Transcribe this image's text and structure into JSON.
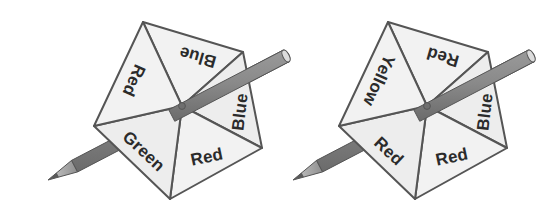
{
  "figure": {
    "background_color": "#ffffff",
    "sector_fill": "#f2f2f2",
    "sector_fill_alt": "#ededed",
    "outline_color": "#555555",
    "pencil_body_color": "#8a8a8a",
    "pencil_shadow_color": "#6e6e6e",
    "pencil_tip_color": "#d9d9d9",
    "label_color": "#2b2b2b"
  },
  "spinners": [
    {
      "id": "spinner-left",
      "name": "left-spinner",
      "shape": "pentagon",
      "sector_count": 5,
      "center": {
        "x": 182,
        "y": 106
      },
      "vertices": [
        {
          "x": 143,
          "y": 22
        },
        {
          "x": 243,
          "y": 52
        },
        {
          "x": 262,
          "y": 148
        },
        {
          "x": 170,
          "y": 199
        },
        {
          "x": 94,
          "y": 126
        }
      ],
      "sectors": [
        {
          "index": 0,
          "label": "Blue",
          "rotation": 196,
          "cx": 198,
          "cy": 56
        },
        {
          "index": 1,
          "label": "Blue",
          "rotation": 277,
          "cx": 241,
          "cy": 112
        },
        {
          "index": 2,
          "label": "Red",
          "rotation": 348,
          "cx": 207,
          "cy": 158
        },
        {
          "index": 3,
          "label": "Green",
          "rotation": 43,
          "cx": 143,
          "cy": 152
        },
        {
          "index": 4,
          "label": "Red",
          "rotation": 114,
          "cx": 133,
          "cy": 80
        }
      ],
      "pencil": {
        "name": "pencil-pointer",
        "tip": {
          "x": 48,
          "y": 180
        },
        "butt": {
          "x": 286,
          "y": 56
        }
      }
    },
    {
      "id": "spinner-right",
      "name": "right-spinner",
      "shape": "pentagon",
      "sector_count": 5,
      "center": {
        "x": 427,
        "y": 106
      },
      "vertices": [
        {
          "x": 388,
          "y": 22
        },
        {
          "x": 488,
          "y": 52
        },
        {
          "x": 507,
          "y": 148
        },
        {
          "x": 415,
          "y": 199
        },
        {
          "x": 339,
          "y": 126
        }
      ],
      "sectors": [
        {
          "index": 0,
          "label": "Red",
          "rotation": 196,
          "cx": 443,
          "cy": 56
        },
        {
          "index": 1,
          "label": "Blue",
          "rotation": 277,
          "cx": 486,
          "cy": 112
        },
        {
          "index": 2,
          "label": "Red",
          "rotation": 348,
          "cx": 452,
          "cy": 158
        },
        {
          "index": 3,
          "label": "Red",
          "rotation": 43,
          "cx": 388,
          "cy": 152
        },
        {
          "index": 4,
          "label": "Yellow",
          "rotation": 114,
          "cx": 378,
          "cy": 80
        }
      ],
      "pencil": {
        "name": "pencil-pointer",
        "tip": {
          "x": 293,
          "y": 180
        },
        "butt": {
          "x": 531,
          "y": 56
        }
      }
    }
  ],
  "labels": {
    "left": [
      "Blue",
      "Blue",
      "Red",
      "Green",
      "Red"
    ],
    "right": [
      "Red",
      "Blue",
      "Red",
      "Red",
      "Yellow"
    ]
  }
}
